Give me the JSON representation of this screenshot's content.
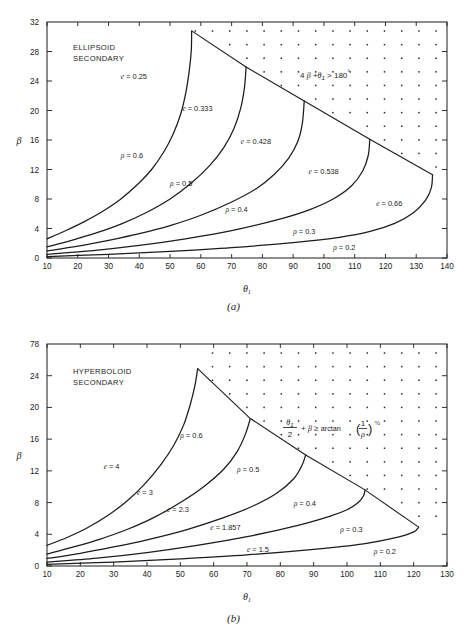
{
  "figures": [
    {
      "id": "a",
      "caption": "(a)",
      "region_label_line1": "ELLIPSOID",
      "region_label_line2": "SECONDARY",
      "chart_data": {
        "type": "line",
        "title": "ELLIPSOID SECONDARY",
        "xlabel": "θ₁",
        "ylabel": "β",
        "xlim": [
          10,
          140
        ],
        "ylim": [
          0,
          32
        ],
        "xticks": [
          10,
          20,
          30,
          40,
          50,
          60,
          70,
          80,
          90,
          100,
          110,
          120,
          130,
          140
        ],
        "yticks": [
          0,
          4,
          8,
          12,
          16,
          20,
          24,
          28,
          32
        ],
        "grid": false,
        "legend": "inline-curve-labels",
        "annotation": "4β + θ₁ > 180°",
        "annotation_parts": {
          "coef": "4",
          "beta": "β",
          "plus": "+",
          "theta": "θ",
          "sub": "1",
          "rel": ">",
          "value": "180",
          "deg": "°"
        },
        "series": [
          {
            "name": "ρ = 0.6",
            "e_label": "e = 0.25",
            "rho": 0.6,
            "e": 0.25,
            "points": [
              [
                10,
                2.6
              ],
              [
                16,
                3.7
              ],
              [
                22,
                4.9
              ],
              [
                28,
                6.3
              ],
              [
                34,
                8.0
              ],
              [
                40,
                10.2
              ],
              [
                44,
                12.0
              ],
              [
                48,
                14.4
              ],
              [
                51,
                16.8
              ],
              [
                53.5,
                19.6
              ],
              [
                55.2,
                22.6
              ],
              [
                56.3,
                25.6
              ],
              [
                56.9,
                28.2
              ],
              [
                57.0,
                30.8
              ]
            ]
          },
          {
            "name": "ρ = 0.5",
            "e_label": "e = 0.333",
            "rho": 0.5,
            "e": 0.333,
            "points": [
              [
                10,
                1.5
              ],
              [
                18,
                2.4
              ],
              [
                26,
                3.4
              ],
              [
                34,
                4.6
              ],
              [
                42,
                6.1
              ],
              [
                50,
                8.0
              ],
              [
                57,
                10.2
              ],
              [
                63,
                12.6
              ],
              [
                67.5,
                15.0
              ],
              [
                70.8,
                17.6
              ],
              [
                73.0,
                20.4
              ],
              [
                74.2,
                23.2
              ],
              [
                74.7,
                25.9
              ]
            ]
          },
          {
            "name": "ρ = 0.4",
            "e_label": "e = 0.428",
            "rho": 0.4,
            "e": 0.428,
            "points": [
              [
                10,
                0.95
              ],
              [
                20,
                1.6
              ],
              [
                30,
                2.4
              ],
              [
                40,
                3.3
              ],
              [
                50,
                4.4
              ],
              [
                60,
                5.8
              ],
              [
                70,
                7.6
              ],
              [
                78,
                9.4
              ],
              [
                84,
                11.4
              ],
              [
                88.5,
                13.5
              ],
              [
                91.5,
                15.8
              ],
              [
                93.0,
                18.3
              ],
              [
                93.6,
                21.3
              ]
            ]
          },
          {
            "name": "ρ = 0.3",
            "e_label": "e = 0.538",
            "rho": 0.3,
            "e": 0.538,
            "points": [
              [
                10,
                0.5
              ],
              [
                25,
                1.0
              ],
              [
                40,
                1.7
              ],
              [
                55,
                2.6
              ],
              [
                70,
                3.7
              ],
              [
                85,
                5.2
              ],
              [
                95,
                6.5
              ],
              [
                103,
                8.0
              ],
              [
                109,
                9.8
              ],
              [
                112.6,
                11.8
              ],
              [
                114.4,
                13.9
              ],
              [
                114.9,
                16.1
              ]
            ]
          },
          {
            "name": "ρ = 0.2",
            "e_label": "e = 0.66",
            "rho": 0.2,
            "e": 0.66,
            "points": [
              [
                10,
                0.2
              ],
              [
                30,
                0.5
              ],
              [
                50,
                0.9
              ],
              [
                70,
                1.4
              ],
              [
                90,
                2.1
              ],
              [
                105,
                2.8
              ],
              [
                115,
                3.6
              ],
              [
                123,
                4.7
              ],
              [
                129,
                6.1
              ],
              [
                133,
                7.8
              ],
              [
                134.9,
                9.5
              ],
              [
                135.3,
                11.3
              ]
            ]
          }
        ],
        "boundary": {
          "name": "4β + θ₁ = 180°",
          "points": [
            [
              57.0,
              30.8
            ],
            [
              74.7,
              25.9
            ],
            [
              93.6,
              21.3
            ],
            [
              114.9,
              16.1
            ],
            [
              135.3,
              11.3
            ]
          ]
        },
        "curve_labels": [
          {
            "text": "e = 0.25",
            "x": 34,
            "y": 24.3,
            "prefix": "e",
            "value": "0.25"
          },
          {
            "text": "e = 0.333",
            "x": 54,
            "y": 20.0,
            "prefix": "e",
            "value": "0.333"
          },
          {
            "text": "e = 0.428",
            "x": 73,
            "y": 15.5,
            "prefix": "e",
            "value": "0.428"
          },
          {
            "text": "e = 0.538",
            "x": 95,
            "y": 11.4,
            "prefix": "e",
            "value": "0.538"
          },
          {
            "text": "e = 0.66",
            "x": 117,
            "y": 7.1,
            "prefix": "e",
            "value": "0.66"
          },
          {
            "text": "ρ = 0.6",
            "x": 34,
            "y": 13.6,
            "prefix": "ρ",
            "value": "0.6"
          },
          {
            "text": "ρ = 0.5",
            "x": 50,
            "y": 9.8,
            "prefix": "ρ",
            "value": "0.5"
          },
          {
            "text": "ρ = 0.4",
            "x": 68,
            "y": 6.2,
            "prefix": "ρ",
            "value": "0.4"
          },
          {
            "text": "ρ = 0.3",
            "x": 90,
            "y": 3.2,
            "prefix": "ρ",
            "value": "0.3"
          },
          {
            "text": "ρ = 0.2",
            "x": 103,
            "y": 1.1,
            "prefix": "ρ",
            "value": "0.2"
          }
        ]
      }
    },
    {
      "id": "b",
      "caption": "(b)",
      "region_label_line1": "HYPERBOLOID",
      "region_label_line2": "SECONDARY",
      "chart_data": {
        "type": "line",
        "title": "HYPERBOLOID SECONDARY",
        "xlabel": "θ₁",
        "ylabel": "β",
        "xlim": [
          10,
          130
        ],
        "ylim": [
          0,
          28
        ],
        "xticks": [
          10,
          20,
          30,
          40,
          50,
          60,
          70,
          80,
          90,
          100,
          110,
          120,
          130
        ],
        "yticks": [
          0,
          4,
          8,
          12,
          16,
          20,
          24,
          78
        ],
        "ytick_top_label": "78",
        "grid": false,
        "legend": "inline-curve-labels",
        "annotation": "θ₁/2 + β ≥ arctan(1/ρ)^½",
        "annotation_parts": {
          "theta": "θ",
          "sub": "1",
          "denom": "2",
          "plus": "+",
          "beta": "β",
          "rel": "≥",
          "fn": "arctan",
          "num": "1",
          "rho": "ρ",
          "exp": "½"
        },
        "series": [
          {
            "name": "ρ = 0.6",
            "e_label": "e = 4",
            "rho": 0.6,
            "e": 4,
            "points": [
              [
                10,
                2.6
              ],
              [
                16,
                3.6
              ],
              [
                22,
                4.8
              ],
              [
                28,
                6.3
              ],
              [
                34,
                8.2
              ],
              [
                39,
                10.2
              ],
              [
                44,
                12.7
              ],
              [
                48,
                15.2
              ],
              [
                51,
                17.8
              ],
              [
                53,
                20.4
              ],
              [
                54.4,
                22.8
              ],
              [
                55.2,
                24.9
              ]
            ]
          },
          {
            "name": "ρ = 0.5",
            "e_label": "e = 3",
            "rho": 0.5,
            "e": 3,
            "points": [
              [
                10,
                1.5
              ],
              [
                18,
                2.4
              ],
              [
                26,
                3.4
              ],
              [
                34,
                4.6
              ],
              [
                42,
                6.1
              ],
              [
                50,
                8.0
              ],
              [
                57,
                10.0
              ],
              [
                63,
                12.2
              ],
              [
                67,
                14.4
              ],
              [
                69.5,
                16.6
              ],
              [
                71.0,
                18.6
              ]
            ]
          },
          {
            "name": "ρ = 0.4",
            "e_label": "e = 2.3",
            "rho": 0.4,
            "e": 2.3,
            "points": [
              [
                10,
                0.95
              ],
              [
                20,
                1.6
              ],
              [
                30,
                2.4
              ],
              [
                40,
                3.3
              ],
              [
                52,
                4.6
              ],
              [
                63,
                6.1
              ],
              [
                72,
                7.6
              ],
              [
                79,
                9.2
              ],
              [
                84,
                11.0
              ],
              [
                86.5,
                12.7
              ],
              [
                87.6,
                14.0
              ]
            ]
          },
          {
            "name": "ρ = 0.3",
            "e_label": "e = 1.857",
            "rho": 0.3,
            "e": 1.857,
            "points": [
              [
                10,
                0.5
              ],
              [
                25,
                1.0
              ],
              [
                40,
                1.7
              ],
              [
                55,
                2.6
              ],
              [
                70,
                3.7
              ],
              [
                85,
                5.1
              ],
              [
                95,
                6.3
              ],
              [
                100,
                7.1
              ],
              [
                103.4,
                8.0
              ],
              [
                105.0,
                8.9
              ],
              [
                105.4,
                9.6
              ]
            ]
          },
          {
            "name": "ρ = 0.2",
            "e_label": "e = 1.5",
            "rho": 0.2,
            "e": 1.5,
            "points": [
              [
                10,
                0.2
              ],
              [
                30,
                0.5
              ],
              [
                50,
                0.9
              ],
              [
                70,
                1.4
              ],
              [
                90,
                2.1
              ],
              [
                105,
                2.8
              ],
              [
                115,
                3.6
              ],
              [
                120,
                4.3
              ],
              [
                121.5,
                4.9
              ]
            ]
          }
        ],
        "boundary": {
          "name": "θ₁/2 + β = arctan(1/ρ)^½",
          "points": [
            [
              55.2,
              24.9
            ],
            [
              71.0,
              18.6
            ],
            [
              87.6,
              14.0
            ],
            [
              105.4,
              9.6
            ],
            [
              121.5,
              4.9
            ]
          ]
        },
        "curve_labels": [
          {
            "text": "e = 4",
            "x": 27,
            "y": 12.2,
            "prefix": "e",
            "value": "4"
          },
          {
            "text": "e = 3",
            "x": 37,
            "y": 9.0,
            "prefix": "e",
            "value": "3"
          },
          {
            "text": "e = 2.3",
            "x": 46,
            "y": 6.8,
            "prefix": "e",
            "value": "2.3"
          },
          {
            "text": "e = 1.857",
            "x": 59,
            "y": 4.6,
            "prefix": "e",
            "value": "1.857"
          },
          {
            "text": "e = 1.5",
            "x": 70,
            "y": 1.8,
            "prefix": "e",
            "value": "1.5"
          },
          {
            "text": "ρ = 0.6",
            "x": 50,
            "y": 16.2,
            "prefix": "ρ",
            "value": "0.6"
          },
          {
            "text": "ρ = 0.5",
            "x": 67,
            "y": 11.9,
            "prefix": "ρ",
            "value": "0.5"
          },
          {
            "text": "ρ = 0.4",
            "x": 84,
            "y": 7.6,
            "prefix": "ρ",
            "value": "0.4"
          },
          {
            "text": "ρ = 0.3",
            "x": 98,
            "y": 4.3,
            "prefix": "ρ",
            "value": "0.3"
          },
          {
            "text": "ρ = 0.2",
            "x": 108,
            "y": 1.5,
            "prefix": "ρ",
            "value": "0.2"
          }
        ]
      }
    }
  ],
  "colors": {
    "ink": "#1c1c1c",
    "background": "#ffffff",
    "dot": "#2a2a2a"
  }
}
